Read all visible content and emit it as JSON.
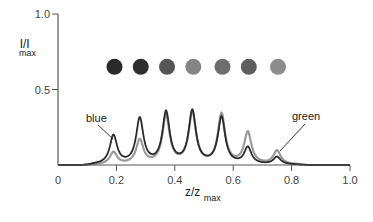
{
  "chart_data": {
    "type": "line",
    "title": "",
    "xlabel": "z/z",
    "xlabel_sub": "max",
    "ylabel": "I/I",
    "ylabel_sub": "max",
    "xlim": [
      0,
      1.0
    ],
    "ylim": [
      0,
      1.0
    ],
    "x_ticks": [
      "0",
      "0.2",
      "0.4",
      "0.6",
      "0.8",
      "1.0"
    ],
    "y_ticks": [
      "0.5",
      "1.0"
    ],
    "grid": false,
    "legend": "none (inline annotations)",
    "peak_positions": [
      0.19,
      0.28,
      0.37,
      0.46,
      0.56,
      0.65,
      0.75
    ],
    "series": [
      {
        "name": "blue",
        "color": "#2b2b2b",
        "width_hwhm": 0.015,
        "values": [
          0.19,
          0.3,
          0.34,
          0.35,
          0.31,
          0.11,
          0.05
        ]
      },
      {
        "name": "green",
        "color": "#9a9a9a",
        "width_hwhm": 0.015,
        "values": [
          0.08,
          0.16,
          0.32,
          0.34,
          0.33,
          0.21,
          0.09
        ]
      }
    ],
    "annotations": [
      {
        "text": "blue",
        "target_peak_index": 0
      },
      {
        "text": "green",
        "target_peak_index": 6
      }
    ],
    "dots": {
      "y": 0.65,
      "colors": [
        "#2a2a2a",
        "#2e2e2e",
        "#555555",
        "#858585",
        "#6e6e6e",
        "#5e5e5e",
        "#8c8c8c"
      ]
    }
  }
}
